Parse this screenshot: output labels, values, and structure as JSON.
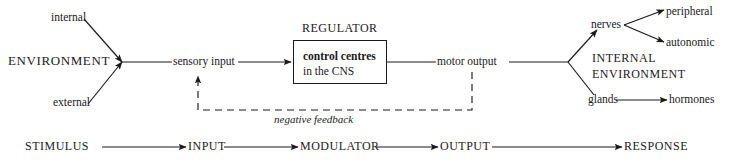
{
  "diagram": {
    "title_internal_note": "homeostasis regulation flow diagram",
    "stroke_color": "#1a1a1a",
    "background": "#ffffff"
  },
  "left": {
    "environment_label": "ENVIRONMENT",
    "internal_label": "internal",
    "external_label": "external",
    "sensory_input_label": "sensory input"
  },
  "regulator": {
    "title": "REGULATOR",
    "box_line1": "control centres",
    "box_line2": "in the CNS",
    "motor_output_label": "motor output",
    "feedback_label": "negative feedback"
  },
  "right": {
    "internal_environment_line1": "INTERNAL",
    "internal_environment_line2": "ENVIRONMENT",
    "nerves_label": "nerves",
    "glands_label": "glands",
    "peripheral_label": "peripheral",
    "autonomic_label": "autonomic",
    "hormones_label": "hormones"
  },
  "bottom_chain": {
    "items": [
      {
        "label": "STIMULUS"
      },
      {
        "label": "INPUT"
      },
      {
        "label": "MODULATOR"
      },
      {
        "label": "OUTPUT"
      },
      {
        "label": "RESPONSE"
      }
    ]
  }
}
